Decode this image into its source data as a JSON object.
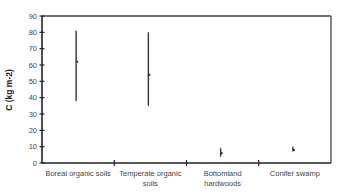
{
  "chart_data": {
    "type": "scatter",
    "subtype": "range_with_mean",
    "title": "",
    "xlabel": "",
    "ylabel": "C (kg m-2)",
    "ylim": [
      0,
      90
    ],
    "yticks": [
      0,
      10,
      20,
      30,
      40,
      50,
      60,
      70,
      80,
      90
    ],
    "grid": false,
    "legend": null,
    "categories": [
      {
        "label_lines": [
          "Boreal organic soils"
        ],
        "mean": 62,
        "min": 38,
        "max": 81
      },
      {
        "label_lines": [
          "Temperate organic",
          "soils"
        ],
        "mean": 54,
        "min": 35,
        "max": 80
      },
      {
        "label_lines": [
          "Bottomland",
          "hardwoods"
        ],
        "mean": 6,
        "min": 4,
        "max": 9
      },
      {
        "label_lines": [
          "Conifer swamp"
        ],
        "mean": 8,
        "min": 7,
        "max": 10
      }
    ]
  },
  "colors": {
    "axis": "#222222",
    "series": "#333333",
    "frame": "#444444"
  }
}
